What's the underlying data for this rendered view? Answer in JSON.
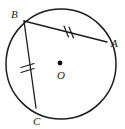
{
  "figure": {
    "type": "geometry-diagram",
    "background_color": "#ffffff",
    "stroke_color": "#1c1c1c",
    "circle": {
      "center_label": "O",
      "center_x": 61,
      "center_y": 64,
      "radius": 55
    },
    "points": [
      {
        "label": "A",
        "x": 107,
        "y": 42,
        "label_x": 111,
        "label_y": 47
      },
      {
        "label": "B",
        "x": 24,
        "y": 21,
        "label_x": 11,
        "label_y": 18
      },
      {
        "label": "C",
        "x": 36,
        "y": 108,
        "label_x": 33,
        "label_y": 124
      }
    ],
    "center_point": {
      "label": "O",
      "dot_x": 60,
      "dot_y": 63,
      "label_x": 57,
      "label_y": 79
    },
    "segments": [
      {
        "name": "chord-BA",
        "from": "B",
        "to": "A",
        "x1": 24,
        "y1": 21,
        "x2": 107,
        "y2": 42,
        "tick_count": 2,
        "tick_label": "congruent-double-tick"
      },
      {
        "name": "chord-BC",
        "from": "B",
        "to": "C",
        "x1": 24,
        "y1": 21,
        "x2": 36,
        "y2": 108,
        "tick_count": 2,
        "tick_label": "congruent-double-tick"
      }
    ],
    "tick_marks": [
      {
        "on_segment": "chord-BA",
        "marks": [
          {
            "x1": 64,
            "y1": 27,
            "x2": 68,
            "y2": 37
          },
          {
            "x1": 69,
            "y1": 28,
            "x2": 73,
            "y2": 38
          }
        ]
      },
      {
        "on_segment": "chord-BC",
        "marks": [
          {
            "x1": 22,
            "y1": 67,
            "x2": 34,
            "y2": 63
          },
          {
            "x1": 22,
            "y1": 72,
            "x2": 34,
            "y2": 68
          }
        ]
      }
    ]
  }
}
